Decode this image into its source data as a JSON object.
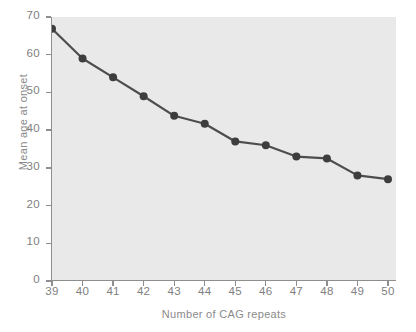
{
  "chart_data": {
    "type": "line",
    "title": "",
    "subtitle": "",
    "xlabel": "Number of CAG repeats",
    "ylabel": "Mean age at onset",
    "x": [
      39,
      40,
      41,
      42,
      43,
      44,
      45,
      46,
      47,
      48,
      49,
      50
    ],
    "values": [
      66.9,
      59.0,
      54.0,
      49.0,
      43.8,
      41.7,
      37.0,
      36.0,
      33.0,
      32.5,
      28.0,
      27.0
    ],
    "series": [
      {
        "name": "Mean age at onset",
        "values": [
          66.9,
          59.0,
          54.0,
          49.0,
          43.8,
          41.7,
          37.0,
          36.0,
          33.0,
          32.5,
          28.0,
          27.0
        ]
      }
    ],
    "xlim": [
      39,
      50
    ],
    "ylim": [
      0,
      70
    ],
    "xticks": [
      39,
      40,
      41,
      42,
      43,
      44,
      45,
      46,
      47,
      48,
      49,
      50
    ],
    "yticks": [
      0,
      10,
      20,
      30,
      40,
      50,
      60,
      70
    ],
    "xtick_labels": [
      "39",
      "40",
      "41",
      "42",
      "43",
      "44",
      "45",
      "46",
      "47",
      "48",
      "49",
      "50"
    ],
    "ytick_labels": [
      "0",
      "10",
      "20",
      "30",
      "40",
      "50",
      "60",
      "70"
    ],
    "grid": false,
    "legend": false,
    "legend_position": "none",
    "annotations": [],
    "colors": {
      "plot_background": "#e9e9e9",
      "figure_background": "#ffffff",
      "line": "#4d4d4d",
      "marker": "#3d3d3d",
      "axis": "#8e8e8e",
      "tick_label": "#808080",
      "axis_title": "#8a8a8a"
    },
    "line_width": 2.2,
    "marker": "circle",
    "marker_size": 4
  }
}
